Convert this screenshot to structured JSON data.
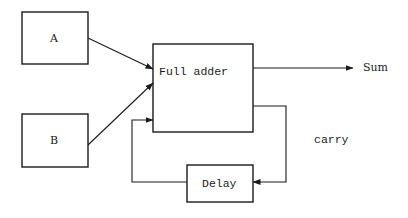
{
  "diagram": {
    "nodes": {
      "a": {
        "label": "A"
      },
      "b": {
        "label": "B"
      },
      "full_adder": {
        "label": "Full adder"
      },
      "delay": {
        "label": "Delay"
      }
    },
    "outputs": {
      "sum": {
        "label": "Sum"
      },
      "carry": {
        "label": "carry"
      }
    },
    "edges": [
      {
        "from": "A",
        "to": "Full adder"
      },
      {
        "from": "B",
        "to": "Full adder"
      },
      {
        "from": "Full adder",
        "to": "Sum"
      },
      {
        "from": "Full adder",
        "to": "Delay",
        "label": "carry"
      },
      {
        "from": "Delay",
        "to": "Full adder"
      }
    ],
    "colors": {
      "stroke": "#1a1a1a",
      "background": "#ffffff"
    }
  }
}
